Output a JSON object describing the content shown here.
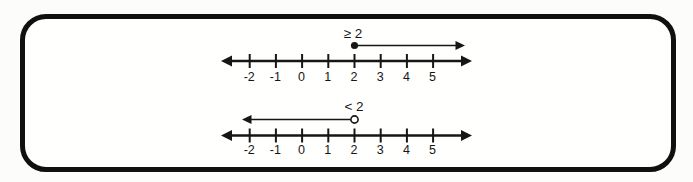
{
  "figure": {
    "background": "#fcfcfb",
    "frame_border_color": "#101010",
    "frame_fill": "#fffffe",
    "ink_color": "#161616"
  },
  "chart_data": [
    {
      "type": "number_line",
      "label": "≥ 2",
      "boundary_value": 2,
      "boundary_marker": "closed",
      "ray_direction": "right",
      "tick_values": [
        -2,
        -1,
        0,
        1,
        2,
        3,
        4,
        5
      ],
      "tick_labels": [
        "-2",
        "-1",
        "0",
        "1",
        "2",
        "3",
        "4",
        "5"
      ],
      "axis_arrows": "both"
    },
    {
      "type": "number_line",
      "label": "< 2",
      "boundary_value": 2,
      "boundary_marker": "open",
      "ray_direction": "left",
      "tick_values": [
        -2,
        -1,
        0,
        1,
        2,
        3,
        4,
        5
      ],
      "tick_labels": [
        "-2",
        "-1",
        "0",
        "1",
        "2",
        "3",
        "4",
        "5"
      ],
      "axis_arrows": "both"
    }
  ]
}
